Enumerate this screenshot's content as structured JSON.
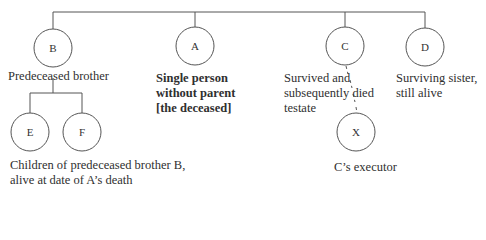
{
  "diagram": {
    "type": "family-tree",
    "nodes": {
      "B": {
        "letter": "B",
        "caption": [
          "Predeceased brother"
        ]
      },
      "A": {
        "letter": "A",
        "caption": [
          "Single person",
          "without parent",
          "[the deceased]"
        ],
        "bold": true
      },
      "C": {
        "letter": "C",
        "caption": [
          "Survived and",
          "subsequently died",
          "testate"
        ]
      },
      "D": {
        "letter": "D",
        "caption": [
          "Surviving sister,",
          "still alive"
        ]
      },
      "E": {
        "letter": "E"
      },
      "F": {
        "letter": "F"
      },
      "X": {
        "letter": "X",
        "caption": [
          "C’s executor"
        ]
      }
    },
    "children_caption": [
      "Children of predeceased brother B,",
      "alive at date of A’s death"
    ],
    "edges": [
      {
        "from": "sibling-bar",
        "to": "B",
        "style": "solid"
      },
      {
        "from": "sibling-bar",
        "to": "A",
        "style": "solid"
      },
      {
        "from": "sibling-bar",
        "to": "C",
        "style": "solid"
      },
      {
        "from": "sibling-bar",
        "to": "D",
        "style": "solid"
      },
      {
        "from": "B",
        "to": "E",
        "style": "solid"
      },
      {
        "from": "B",
        "to": "F",
        "style": "solid"
      },
      {
        "from": "C",
        "to": "X",
        "style": "dashed"
      }
    ],
    "colors": {
      "line": "#555555",
      "text": "#2f2f2f",
      "background": "#ffffff"
    }
  }
}
